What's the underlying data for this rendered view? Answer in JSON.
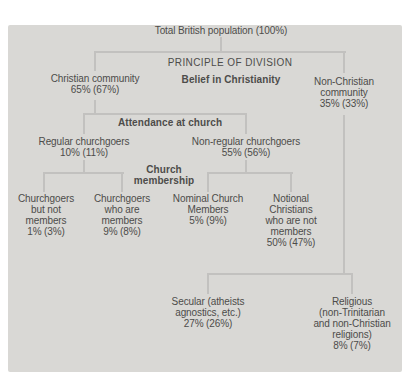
{
  "figure": {
    "background": "#ffffff",
    "panel_color": "#d9d8d5",
    "line_color": "#c2c1bf",
    "text_color": "#4d4c4a"
  },
  "tree": {
    "total": {
      "lines": [
        "Total British population (100%)"
      ]
    },
    "principle_label": {
      "lines": [
        "PRINCIPLE OF DIVISION"
      ]
    },
    "belief_label": {
      "lines": [
        "Belief in Christianity"
      ]
    },
    "christian": {
      "lines": [
        "Christian community",
        "65% (67%)"
      ]
    },
    "non_christian": {
      "lines": [
        "Non-Christian",
        "community",
        "35% (33%)"
      ]
    },
    "attendance_label": {
      "lines": [
        "Attendance at church"
      ]
    },
    "regular": {
      "lines": [
        "Regular churchgoers",
        "10% (11%)"
      ]
    },
    "non_regular": {
      "lines": [
        "Non-regular churchgoers",
        "55% (56%)"
      ]
    },
    "membership_label": {
      "lines": [
        "Church",
        "membership"
      ]
    },
    "churchgoers_not_members": {
      "lines": [
        "Churchgoers",
        "but not",
        "members",
        "1% (3%)"
      ]
    },
    "churchgoers_members": {
      "lines": [
        "Churchgoers",
        "who are",
        "members",
        "9% (8%)"
      ]
    },
    "nominal_members": {
      "lines": [
        "Nominal Church",
        "Members",
        "5% (9%)"
      ]
    },
    "notional_christians": {
      "lines": [
        "Notional",
        "Christians",
        "who are not",
        "members",
        "50% (47%)"
      ]
    },
    "secular": {
      "lines": [
        "Secular (atheists",
        "agnostics, etc.)",
        "27% (26%)"
      ]
    },
    "religious": {
      "lines": [
        "Religious",
        "(non-Trinitarian",
        "and non-Christian",
        "religions)",
        "8% (7%)"
      ]
    }
  }
}
